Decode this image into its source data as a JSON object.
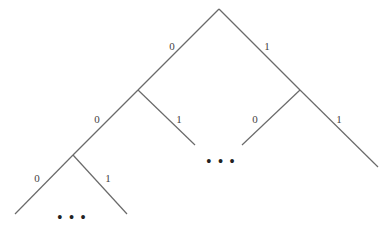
{
  "diagram": {
    "type": "binary-tree",
    "nodes": {
      "root": {
        "x": 219,
        "y": 9
      },
      "n0": {
        "x": 138,
        "y": 90
      },
      "n1": {
        "x": 300,
        "y": 90
      },
      "n00": {
        "x": 73,
        "y": 155
      },
      "n01_end": {
        "x": 195,
        "y": 145
      },
      "n10_end": {
        "x": 242,
        "y": 145
      },
      "n11_end": {
        "x": 378,
        "y": 167
      },
      "n000_end": {
        "x": 15,
        "y": 214
      },
      "n001_end": {
        "x": 127,
        "y": 214
      }
    },
    "edges": [
      {
        "id": "root-0",
        "label": "0",
        "from": "root",
        "to": "n0",
        "lx": 172,
        "ly": 50
      },
      {
        "id": "root-1",
        "label": "1",
        "from": "root",
        "to": "n1",
        "lx": 267,
        "ly": 50
      },
      {
        "id": "n0-0",
        "label": "0",
        "from": "n0",
        "to": "n00",
        "lx": 97,
        "ly": 123
      },
      {
        "id": "n0-1",
        "label": "1",
        "from": "n0",
        "to": "n01_end",
        "lx": 179,
        "ly": 123
      },
      {
        "id": "n1-0",
        "label": "0",
        "from": "n1",
        "to": "n10_end",
        "lx": 255,
        "ly": 123
      },
      {
        "id": "n1-1",
        "label": "1",
        "from": "n1",
        "to": "n11_end",
        "lx": 339,
        "ly": 123
      },
      {
        "id": "n00-0",
        "label": "0",
        "from": "n00",
        "to": "n000_end",
        "lx": 37,
        "ly": 182
      },
      {
        "id": "n00-1",
        "label": "1",
        "from": "n00",
        "to": "n001_end",
        "lx": 108,
        "ly": 182
      }
    ],
    "ellipses": [
      {
        "id": "middle-ellipsis",
        "text": "• • •",
        "x": 221,
        "y": 167
      },
      {
        "id": "bottom-ellipsis",
        "text": "• • •",
        "x": 72,
        "y": 223
      }
    ]
  }
}
